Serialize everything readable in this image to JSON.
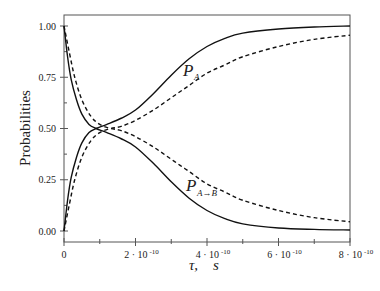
{
  "chart_data": {
    "type": "line",
    "title": "",
    "xlabel": "τ, s",
    "ylabel": "Probabilities",
    "xlim": [
      0,
      8e-10
    ],
    "ylim": [
      0,
      1.0
    ],
    "grid": false,
    "legend": "none (inline curve labels)",
    "x_ticks": [
      {
        "value": 0,
        "label": "0",
        "exp": ""
      },
      {
        "value": 2e-10,
        "label": "2 · 10",
        "exp": "-10"
      },
      {
        "value": 4e-10,
        "label": "4 · 10",
        "exp": "-10"
      },
      {
        "value": 6e-10,
        "label": "6 · 10",
        "exp": "-10"
      },
      {
        "value": 8e-10,
        "label": "8 · 10",
        "exp": "-10"
      }
    ],
    "x_minor_ticks": [
      1e-10,
      3e-10,
      5e-10,
      7e-10
    ],
    "y_ticks": [
      {
        "value": 0.0,
        "label": "0.00"
      },
      {
        "value": 0.25,
        "label": "0.25"
      },
      {
        "value": 0.5,
        "label": "0.50"
      },
      {
        "value": 0.75,
        "label": "0.75"
      },
      {
        "value": 1.0,
        "label": "1.00"
      }
    ],
    "y_minor_ticks": [
      0.125,
      0.375,
      0.625,
      0.875
    ],
    "x_unit_scale": "1e-10 s",
    "series": [
      {
        "name": "P_A (solid, rising)",
        "style": "solid",
        "x": [
          0,
          0.1,
          0.2,
          0.35,
          0.5,
          0.7,
          0.9,
          1.2,
          1.6,
          2.0,
          2.5,
          3.0,
          3.5,
          4.0,
          4.5,
          5.0,
          6.0,
          7.0,
          8.0
        ],
        "y": [
          0.0,
          0.15,
          0.26,
          0.36,
          0.43,
          0.48,
          0.5,
          0.52,
          0.55,
          0.59,
          0.67,
          0.76,
          0.84,
          0.9,
          0.94,
          0.965,
          0.985,
          0.995,
          1.0
        ]
      },
      {
        "name": "P_A complement (solid, falling)",
        "style": "solid",
        "x": [
          0,
          0.1,
          0.2,
          0.35,
          0.5,
          0.7,
          0.9,
          1.2,
          1.6,
          2.0,
          2.5,
          3.0,
          3.5,
          4.0,
          4.5,
          5.0,
          6.0,
          7.0,
          8.0
        ],
        "y": [
          1.0,
          0.85,
          0.74,
          0.64,
          0.57,
          0.52,
          0.5,
          0.48,
          0.45,
          0.41,
          0.33,
          0.24,
          0.16,
          0.1,
          0.06,
          0.035,
          0.015,
          0.008,
          0.005
        ]
      },
      {
        "name": "P_A→B (dashed, rising)",
        "style": "dashed",
        "x": [
          0,
          0.15,
          0.3,
          0.5,
          0.75,
          1.0,
          1.3,
          1.6,
          2.0,
          2.5,
          3.0,
          3.5,
          4.0,
          4.5,
          5.0,
          6.0,
          7.0,
          8.0
        ],
        "y": [
          0.0,
          0.13,
          0.25,
          0.36,
          0.44,
          0.48,
          0.5,
          0.51,
          0.54,
          0.59,
          0.65,
          0.71,
          0.77,
          0.81,
          0.85,
          0.9,
          0.935,
          0.955
        ]
      },
      {
        "name": "P_A→B complement (dashed, falling)",
        "style": "dashed",
        "x": [
          0,
          0.15,
          0.3,
          0.5,
          0.75,
          1.0,
          1.3,
          1.6,
          2.0,
          2.5,
          3.0,
          3.5,
          4.0,
          4.5,
          5.0,
          6.0,
          7.0,
          8.0
        ],
        "y": [
          1.0,
          0.87,
          0.75,
          0.64,
          0.56,
          0.52,
          0.5,
          0.49,
          0.46,
          0.41,
          0.35,
          0.29,
          0.23,
          0.19,
          0.15,
          0.1,
          0.065,
          0.045
        ]
      }
    ],
    "annotations": [
      {
        "text": "P",
        "sub": "A",
        "x": 3.35,
        "y": 0.77
      },
      {
        "text": "P",
        "sub": "A→B",
        "x": 3.4,
        "y": 0.225
      }
    ]
  },
  "labels": {
    "ylabel": "Probabilities",
    "xlabel_tau": "τ,",
    "xlabel_unit": "s",
    "pa_main": "P",
    "pa_sub": "A",
    "pab_main": "P",
    "pab_sub": "A→B"
  }
}
